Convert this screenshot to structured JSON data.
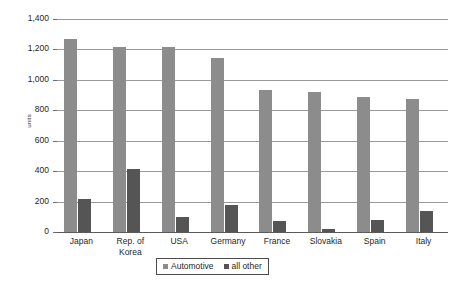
{
  "chart_data": {
    "type": "bar",
    "title": "",
    "subtitle": "",
    "xlabel": "",
    "ylabel": "units",
    "ylim": [
      0,
      1400
    ],
    "ytick_step": 200,
    "yticks": [
      "0",
      "200",
      "400",
      "600",
      "800",
      "1,000",
      "1,200",
      "1,400"
    ],
    "ytick_values": [
      0,
      200,
      400,
      600,
      800,
      1000,
      1200,
      1400
    ],
    "grid": "horizontal",
    "legend_position": "bottom-center",
    "categories": [
      "Japan",
      "Rep. of\nKorea",
      "USA",
      "Germany",
      "France",
      "Slovakia",
      "Spain",
      "Italy"
    ],
    "series": [
      {
        "name": "Automotive",
        "color": "#8c8c8c",
        "values": [
          1270,
          1215,
          1215,
          1145,
          935,
          920,
          885,
          875
        ]
      },
      {
        "name": "all other",
        "color": "#555555",
        "values": [
          215,
          415,
          100,
          175,
          70,
          20,
          80,
          135
        ]
      }
    ]
  },
  "colors": {
    "background": "#ffffff",
    "gridline": "#9a9a9a",
    "axis": "#5a5a5a",
    "text": "#1f1f1f",
    "automotive": "#8c8c8c",
    "all_other": "#555555"
  }
}
